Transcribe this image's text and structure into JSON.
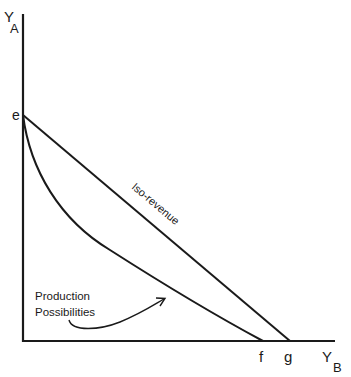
{
  "diagram": {
    "y_axis": {
      "label_main": "Y",
      "label_sub": "A"
    },
    "x_axis": {
      "label_main": "Y",
      "label_sub": "B"
    },
    "points": {
      "e": "e",
      "f": "f",
      "g": "g"
    },
    "iso_revenue_label": "Iso-revenue",
    "ppf_label_line1": "Production",
    "ppf_label_line2": "Possibilities",
    "line_color": "#1a1a1a",
    "background": "#ffffff"
  }
}
